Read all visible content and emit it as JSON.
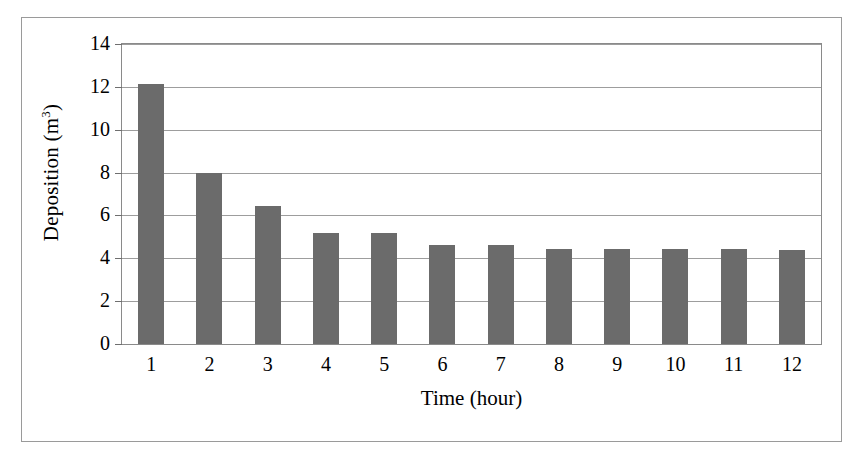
{
  "chart_data": {
    "type": "bar",
    "title": "",
    "xlabel": "Time (hour)",
    "ylabel_text": "Deposition (m",
    "ylabel_sup": "3",
    "ylabel_tail": ")",
    "ylabel_full": "Deposition (m3)",
    "categories": [
      "1",
      "2",
      "3",
      "4",
      "5",
      "6",
      "7",
      "8",
      "9",
      "10",
      "11",
      "12"
    ],
    "values": [
      12.15,
      8.0,
      6.45,
      5.2,
      5.2,
      4.6,
      4.6,
      4.45,
      4.45,
      4.45,
      4.45,
      4.4
    ],
    "ylim": [
      0,
      14
    ],
    "yticks": [
      "0",
      "2",
      "4",
      "6",
      "8",
      "10",
      "12",
      "14"
    ],
    "ytick_values": [
      0,
      2,
      4,
      6,
      8,
      10,
      12,
      14
    ],
    "grid": true,
    "legend": "none",
    "series_name": "Deposition",
    "bar_color": "#6b6b6b",
    "grid_color": "#9d9d9d",
    "axis_color": "#8a8a8a",
    "frame_color": "#9a9a9a",
    "background": "#ffffff"
  }
}
